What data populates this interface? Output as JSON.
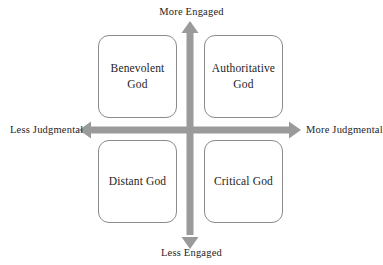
{
  "diagram": {
    "axes": {
      "vertical": {
        "top_label": "More Engaged",
        "bottom_label": "Less Engaged",
        "color": "#9a9a9a"
      },
      "horizontal": {
        "left_label": "Less Judgmental",
        "right_label": "More Judgmental",
        "color": "#9a9a9a"
      }
    },
    "quadrants": [
      {
        "id": "top-left",
        "label": "Benevolent\nGod",
        "engagement": "More Engaged",
        "judgment": "Less Judgmental",
        "border_color": "#8b8b8b",
        "fill_color": "#ffffff"
      },
      {
        "id": "top-right",
        "label": "Authoritative\nGod",
        "engagement": "More Engaged",
        "judgment": "More Judgmental",
        "border_color": "#8b8b8b",
        "fill_color": "#ffffff"
      },
      {
        "id": "bottom-left",
        "label": "Distant God",
        "engagement": "Less Engaged",
        "judgment": "Less Judgmental",
        "border_color": "#8b8b8b",
        "fill_color": "#ffffff"
      },
      {
        "id": "bottom-right",
        "label": "Critical God",
        "engagement": "Less Engaged",
        "judgment": "More Judgmental",
        "border_color": "#8b8b8b",
        "fill_color": "#ffffff"
      }
    ],
    "text_color": "#1d1d1d",
    "background_color": "#ffffff"
  }
}
